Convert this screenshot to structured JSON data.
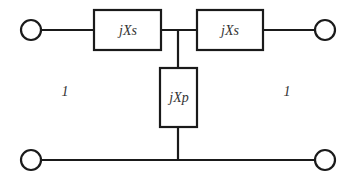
{
  "diagram": {
    "type": "T-network equivalent circuit",
    "colors": {
      "line": "#1a1a1a",
      "text": "#333333",
      "background": "#ffffff"
    },
    "components": {
      "series_left": {
        "label": "jXs"
      },
      "series_right": {
        "label": "jXs"
      },
      "shunt": {
        "label": "jXp"
      }
    },
    "port_labels": {
      "left": "1",
      "right": "1"
    },
    "terminals": [
      "top-left",
      "top-right",
      "bottom-left",
      "bottom-right"
    ]
  }
}
